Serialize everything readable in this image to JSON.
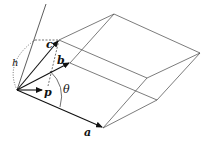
{
  "diagram": {
    "type": "parallelepiped-vectors",
    "labels": {
      "a": "a",
      "b": "b",
      "c": "c",
      "p": "p",
      "h": "h",
      "theta": "θ"
    },
    "colors": {
      "line": "#333333",
      "vector": "#111111",
      "background": "#ffffff"
    },
    "points": {
      "origin": [
        17,
        90
      ],
      "a_tip": [
        103,
        128
      ],
      "b_tip": [
        70,
        63
      ],
      "c_tip": [
        59,
        40
      ],
      "p_tip": [
        42,
        90
      ],
      "top": [
        114,
        14
      ],
      "right": [
        200,
        53
      ],
      "mid_upper": [
        147,
        78
      ],
      "mid_lower": [
        157,
        100
      ]
    }
  }
}
